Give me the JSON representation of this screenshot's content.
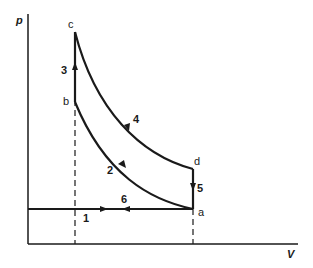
{
  "diagram": {
    "axes": {
      "y_label": "p",
      "x_label": "V"
    },
    "points": {
      "a": "a",
      "b": "b",
      "c": "c",
      "d": "d"
    },
    "processes": [
      {
        "id": "1",
        "label": "1",
        "from": "intake-start",
        "to": "a",
        "type": "isobaric intake"
      },
      {
        "id": "2",
        "label": "2",
        "from": "a",
        "to": "b",
        "type": "compression"
      },
      {
        "id": "3",
        "label": "3",
        "from": "b",
        "to": "c",
        "type": "constant-volume heat addition"
      },
      {
        "id": "4",
        "label": "4",
        "from": "c",
        "to": "d",
        "type": "expansion"
      },
      {
        "id": "5",
        "label": "5",
        "from": "d",
        "to": "a",
        "type": "constant-volume heat rejection"
      },
      {
        "id": "6",
        "label": "6",
        "from": "a",
        "to": "intake-start",
        "type": "isobaric exhaust"
      }
    ],
    "colors": {
      "line": "#1a1a1a",
      "background": "#ffffff"
    }
  }
}
